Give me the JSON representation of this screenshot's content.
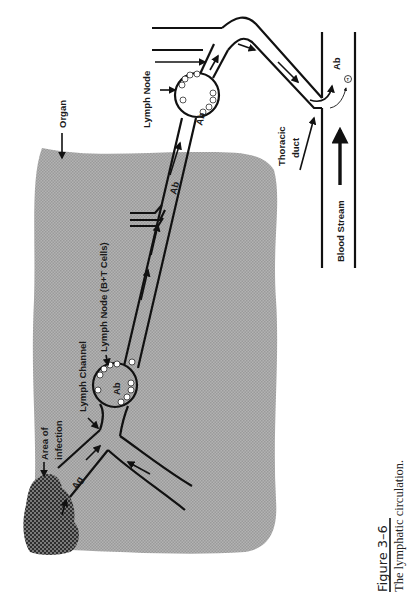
{
  "figure": {
    "number": "Figure 3–6",
    "caption": "The lymphatic circulation.",
    "orientation": "rotated 90° counter-clockwise"
  },
  "labels": {
    "organ": "Organ",
    "area_of_infection_line1": "Area of",
    "area_of_infection_line2": "infection",
    "lymph_channel": "Lymph Channel",
    "lymph_node_bt": "Lymph Node (B+T Cells)",
    "lymph_node": "Lymph Node",
    "thoracic_duct_line1": "Thoracic",
    "thoracic_duct_line2": "duct",
    "blood_stream": "Blood Stream",
    "antigen": "Ag",
    "antibody": "Ab"
  },
  "cells": {
    "b_cell": "B",
    "t_cell": "T"
  },
  "colors": {
    "organ_fill": "#a9a9a9",
    "infection_fill": "#4a4a4a",
    "line": "#111111",
    "background": "#ffffff"
  }
}
